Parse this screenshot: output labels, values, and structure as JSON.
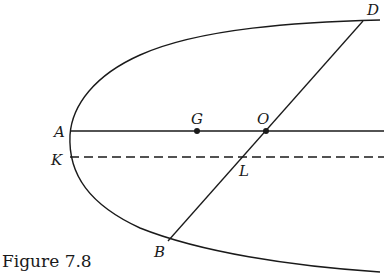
{
  "figure": {
    "caption": "Figure 7.8",
    "labels": {
      "A": "A",
      "G": "G",
      "O": "O",
      "D": "D",
      "K": "K",
      "L": "L",
      "B": "B"
    },
    "elements": [
      "parabola opening right with vertex near A",
      "solid axis line through A, G, O",
      "dashed line through K and L parallel to axis",
      "chord DB passing through O and L"
    ],
    "colors": {
      "ink": "#1a1a1a",
      "background": "#ffffff"
    }
  }
}
